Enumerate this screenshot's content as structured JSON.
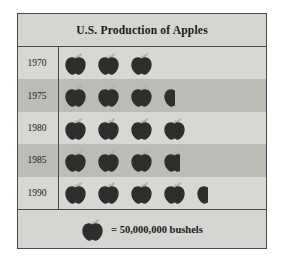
{
  "chart": {
    "title": "U.S. Production of Apples",
    "legend": {
      "icon": "apple-icon",
      "text": "= 50,000,000 bushels"
    }
  },
  "chart_data": {
    "type": "pictograph",
    "title": "U.S. Production of Apples",
    "xlabel": "",
    "ylabel": "",
    "unit_label": "= 50,000,000 bushels",
    "unit_value": 50000000,
    "unit_symbol": "apple",
    "categories": [
      "1970",
      "1975",
      "1980",
      "1985",
      "1990"
    ],
    "values": [
      3,
      3.5,
      4,
      3.75,
      4.5
    ],
    "icon_counts": [
      {
        "year": "1970",
        "full": 3,
        "partial": 0,
        "bushels": 150000000
      },
      {
        "year": "1975",
        "full": 3,
        "partial": 0.5,
        "bushels": 175000000
      },
      {
        "year": "1980",
        "full": 4,
        "partial": 0,
        "bushels": 200000000
      },
      {
        "year": "1985",
        "full": 3,
        "partial": 0.75,
        "bushels": 187500000
      },
      {
        "year": "1990",
        "full": 4,
        "partial": 0.5,
        "bushels": 225000000
      }
    ],
    "row_bands": [
      "light",
      "dark",
      "light",
      "dark",
      "light"
    ],
    "grid": false,
    "legend_position": "bottom",
    "colors": {
      "icon": "#2e2e2e",
      "leaf": "#b0b0ac",
      "band_light": "#d7d7d3",
      "band_dark": "#bcbcb7",
      "header": "#d5d5d1",
      "border": "#4a4a4a",
      "text": "#1a1a1a"
    }
  },
  "rows": [
    {
      "year": "1970",
      "full": 3,
      "partial": 0,
      "band": "light"
    },
    {
      "year": "1975",
      "full": 3,
      "partial": 0.5,
      "band": "dark"
    },
    {
      "year": "1980",
      "full": 4,
      "partial": 0,
      "band": "light"
    },
    {
      "year": "1985",
      "full": 3,
      "partial": 0.75,
      "band": "dark"
    },
    {
      "year": "1990",
      "full": 4,
      "partial": 0.5,
      "band": "light"
    }
  ]
}
